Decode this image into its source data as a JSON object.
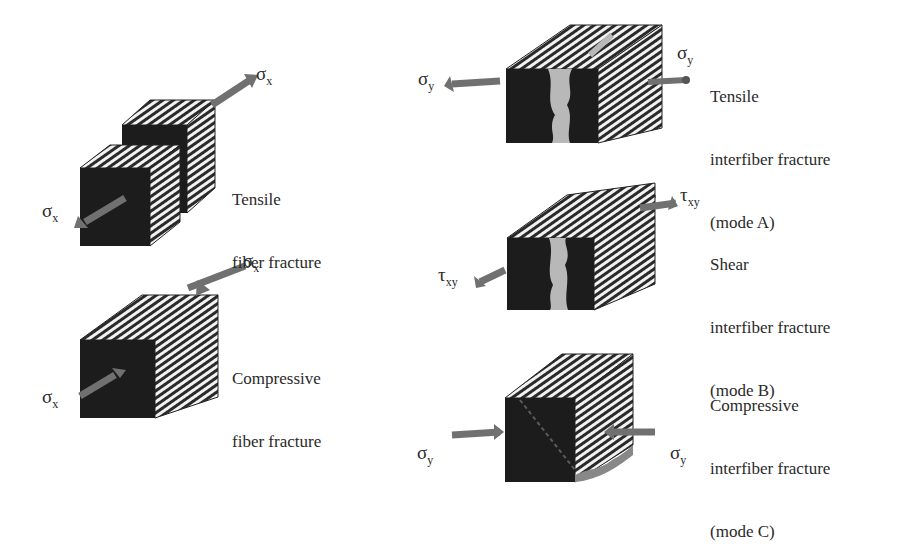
{
  "figure": {
    "panels": [
      {
        "id": "tensile-fiber",
        "label_lines": [
          "Tensile",
          "fiber fracture"
        ],
        "stresses": [
          {
            "symbol": "σ",
            "sub": "x",
            "position": "top-right"
          },
          {
            "symbol": "σ",
            "sub": "x",
            "position": "bottom-left"
          }
        ]
      },
      {
        "id": "compressive-fiber",
        "label_lines": [
          "Compressive",
          "fiber fracture"
        ],
        "stresses": [
          {
            "symbol": "σ",
            "sub": "x",
            "position": "top-right"
          },
          {
            "symbol": "σ",
            "sub": "x",
            "position": "bottom-left"
          }
        ]
      },
      {
        "id": "tensile-interfiber-mode-a",
        "label_lines": [
          "Tensile",
          "interfiber fracture",
          "(mode A)"
        ],
        "stresses": [
          {
            "symbol": "σ",
            "sub": "y",
            "position": "left"
          },
          {
            "symbol": "σ",
            "sub": "y",
            "position": "right"
          }
        ]
      },
      {
        "id": "shear-interfiber-mode-b",
        "label_lines": [
          "Shear",
          "interfiber fracture",
          "(mode B)"
        ],
        "stresses": [
          {
            "symbol": "τ",
            "sub": "xy",
            "position": "top-right"
          },
          {
            "symbol": "τ",
            "sub": "xy",
            "position": "bottom-left"
          }
        ]
      },
      {
        "id": "compressive-interfiber-mode-c",
        "label_lines": [
          "Compressive",
          "interfiber fracture",
          "(mode C)"
        ],
        "stresses": [
          {
            "symbol": "σ",
            "sub": "y",
            "position": "left"
          },
          {
            "symbol": "σ",
            "sub": "y",
            "position": "right"
          }
        ]
      }
    ]
  },
  "colors": {
    "cube_face": "#1c1c1c",
    "stripe_dark": "#2a2a2a",
    "stripe_light": "#f2f2f2",
    "arrow": "#707070",
    "crack": "#b8b8b8"
  }
}
